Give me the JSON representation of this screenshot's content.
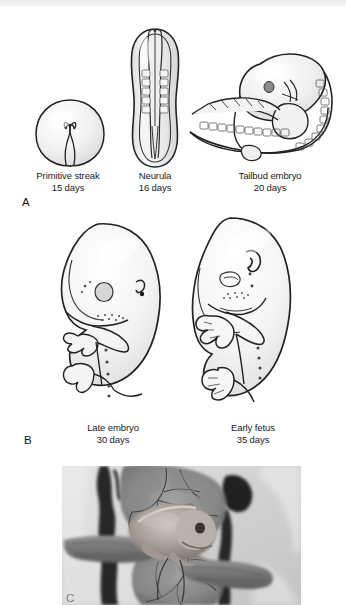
{
  "figure": {
    "type": "scientific-illustration"
  },
  "panels": [
    {
      "letter": "A",
      "stages": [
        {
          "name": "Primitive streak",
          "age": "15 days",
          "icon": "primitive-streak-disc"
        },
        {
          "name": "Neurula",
          "age": "16 days",
          "icon": "neurula-neural-groove"
        },
        {
          "name": "Tailbud embryo",
          "age": "20 days",
          "icon": "tailbud-embryo-somites"
        }
      ]
    },
    {
      "letter": "B",
      "stages": [
        {
          "name": "Late embryo",
          "age": "30 days",
          "icon": "late-embryo-limb-buds"
        },
        {
          "name": "Early fetus",
          "age": "35 days",
          "icon": "early-fetus-digits"
        }
      ]
    },
    {
      "letter": "C",
      "stages": [
        {
          "name": "",
          "age": "",
          "icon": "uterine-specimen-photograph"
        }
      ]
    }
  ],
  "colors": {
    "ink": "#1a1a1a",
    "fill_light": "#f4f4f4",
    "fill_shade": "#e2e2e2",
    "top_strip": "#ececec",
    "photo_base": "#b9b9b9"
  }
}
